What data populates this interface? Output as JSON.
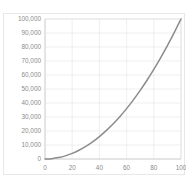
{
  "chart_data": {
    "type": "line",
    "title": "",
    "xlabel": "",
    "ylabel": "",
    "xlim": [
      0,
      100
    ],
    "ylim": [
      0,
      100000
    ],
    "grid": true,
    "legend": false,
    "legend_position": "none",
    "series_color": "#8c8c8c",
    "grid_color": "#e4e4e4",
    "label_color": "#8a8a8a",
    "x_tick_labels": [
      "0",
      "20",
      "40",
      "60",
      "80",
      "100"
    ],
    "x_ticks": [
      0,
      20,
      40,
      60,
      80,
      100
    ],
    "y_tick_labels": [
      "0",
      "10,000",
      "20,000",
      "30,000",
      "40,000",
      "50,000",
      "60,000",
      "70,000",
      "80,000",
      "90,000",
      "100,000"
    ],
    "y_ticks": [
      0,
      10000,
      20000,
      30000,
      40000,
      50000,
      60000,
      70000,
      80000,
      90000,
      100000
    ],
    "series": [
      {
        "name": "",
        "x": [
          0,
          5,
          10,
          15,
          20,
          25,
          30,
          35,
          40,
          45,
          50,
          55,
          60,
          65,
          70,
          75,
          80,
          85,
          90,
          95,
          100
        ],
        "values": [
          0,
          250,
          1000,
          2250,
          4000,
          6250,
          9000,
          12250,
          16000,
          20250,
          25000,
          30250,
          36000,
          42250,
          49000,
          56250,
          64000,
          72250,
          81000,
          90250,
          100000
        ]
      }
    ]
  }
}
